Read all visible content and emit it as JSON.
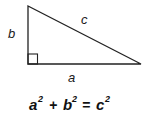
{
  "diagram": {
    "type": "right-triangle",
    "labels": {
      "a": "a",
      "b": "b",
      "c": "c"
    },
    "formula": {
      "a": "a",
      "b": "b",
      "c": "c",
      "exp": "2",
      "plus": "+",
      "equals": "="
    },
    "colors": {
      "stroke": "#222222",
      "text": "#111111",
      "background": "#ffffff"
    }
  }
}
